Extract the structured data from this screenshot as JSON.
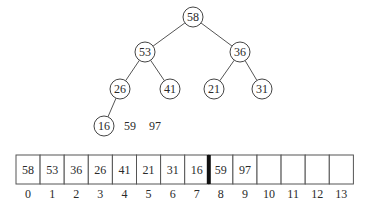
{
  "tree": {
    "nodes": [
      {
        "id": "n0",
        "value": "58",
        "cx": 193,
        "cy": 17
      },
      {
        "id": "n1",
        "value": "53",
        "cx": 145,
        "cy": 52
      },
      {
        "id": "n2",
        "value": "36",
        "cx": 240,
        "cy": 52
      },
      {
        "id": "n3",
        "value": "26",
        "cx": 120,
        "cy": 89
      },
      {
        "id": "n4",
        "value": "41",
        "cx": 170,
        "cy": 89
      },
      {
        "id": "n5",
        "value": "21",
        "cx": 214,
        "cy": 89
      },
      {
        "id": "n6",
        "value": "31",
        "cx": 262,
        "cy": 89
      },
      {
        "id": "n7",
        "value": "16",
        "cx": 104,
        "cy": 126
      }
    ],
    "edges": [
      [
        "n0",
        "n1"
      ],
      [
        "n0",
        "n2"
      ],
      [
        "n1",
        "n3"
      ],
      [
        "n1",
        "n4"
      ],
      [
        "n2",
        "n5"
      ],
      [
        "n2",
        "n6"
      ],
      [
        "n3",
        "n7"
      ]
    ],
    "loose_values": [
      {
        "value": "59",
        "x": 130,
        "y": 126
      },
      {
        "value": "97",
        "x": 155,
        "y": 126
      }
    ]
  },
  "array": {
    "cells": [
      "58",
      "53",
      "36",
      "26",
      "41",
      "21",
      "31",
      "16",
      "59",
      "97",
      "",
      "",
      "",
      ""
    ],
    "indices": [
      "0",
      "1",
      "2",
      "3",
      "4",
      "5",
      "6",
      "7",
      "8",
      "9",
      "10",
      "11",
      "12",
      "13"
    ],
    "divider_after_index": 7
  }
}
